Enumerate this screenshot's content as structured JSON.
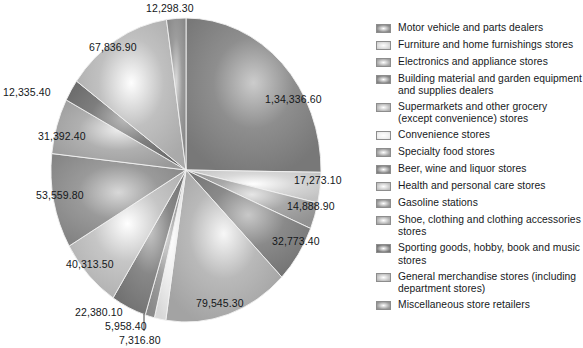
{
  "chart_data": {
    "type": "pie",
    "title": "",
    "legend_position": "right",
    "value_format": "indian-grouping",
    "categories": [
      "Motor vehicle and parts dealers",
      "Furniture and home furnishings stores",
      "Electronics and appliance stores",
      "Building material and garden equipment and supplies dealers",
      "Supermarkets and other grocery (except convenience) stores",
      "Convenience stores",
      "Specialty food stores",
      "Beer, wine and liquor stores",
      "Health and personal care stores",
      "Gasoline stations",
      "Shoe, clothing and clothing accessories stores",
      "Sporting goods, hobby, book and music stores",
      "General merchandise stores (including department stores)",
      "Miscellaneous store retailers"
    ],
    "values": [
      134336.6,
      17273.1,
      14888.9,
      32773.4,
      79545.3,
      7316.8,
      5958.4,
      22380.1,
      40313.5,
      53559.8,
      31392.4,
      12335.4,
      67836.9,
      12298.3
    ],
    "value_labels": [
      "1,34,336.60",
      "17,273.10",
      "14,888.90",
      "32,773.40",
      "79,545.30",
      "7,316.80",
      "5,958.40",
      "22,380.10",
      "40,313.50",
      "53,559.80",
      "31,392.40",
      "12,335.40",
      "67,836.90",
      "12,298.30"
    ],
    "slice_colors": [
      "#8e8e8e",
      "#d8d8d8",
      "#a8a8a8",
      "#8a8a8a",
      "#b9b9b9",
      "#eeeeee",
      "#a0a0a0",
      "#888888",
      "#c6c6c6",
      "#9a9a9a",
      "#b0b0b0",
      "#7e7e7e",
      "#c0c0c0",
      "#9c9c9c"
    ],
    "xlabel": "",
    "ylabel": ""
  },
  "legend": {
    "items": [
      {
        "label": "Motor vehicle and parts dealers",
        "color": "#8e8e8e"
      },
      {
        "label": "Furniture and home furnishings stores",
        "color": "#d8d8d8"
      },
      {
        "label": "Electronics and appliance stores",
        "color": "#a8a8a8"
      },
      {
        "label": "Building material and garden equipment and supplies dealers",
        "color": "#8a8a8a"
      },
      {
        "label": "Supermarkets and other grocery (except convenience) stores",
        "color": "#b9b9b9"
      },
      {
        "label": "Convenience stores",
        "color": "#eeeeee"
      },
      {
        "label": "Specialty food stores",
        "color": "#a0a0a0"
      },
      {
        "label": "Beer, wine and liquor stores",
        "color": "#888888"
      },
      {
        "label": "Health and personal care stores",
        "color": "#c6c6c6"
      },
      {
        "label": "Gasoline stations",
        "color": "#9a9a9a"
      },
      {
        "label": "Shoe, clothing and clothing accessories stores",
        "color": "#b0b0b0"
      },
      {
        "label": "Sporting goods, hobby, book and music stores",
        "color": "#7e7e7e"
      },
      {
        "label": "General merchandise stores (including department stores)",
        "color": "#c0c0c0"
      },
      {
        "label": "Miscellaneous store retailers",
        "color": "#9c9c9c"
      }
    ]
  },
  "pie_labels": [
    {
      "text": "12,298.30",
      "left": 146,
      "top": 2
    },
    {
      "text": "1,34,336.60",
      "left": 265,
      "top": 93
    },
    {
      "text": "17,273.10",
      "left": 294,
      "top": 174
    },
    {
      "text": "14,888.90",
      "left": 287,
      "top": 200
    },
    {
      "text": "32,773.40",
      "left": 272,
      "top": 235
    },
    {
      "text": "79,545.30",
      "left": 196,
      "top": 297
    },
    {
      "text": "7,316.80",
      "left": 119,
      "top": 334
    },
    {
      "text": "5,958.40",
      "left": 105,
      "top": 320
    },
    {
      "text": "22,380.10",
      "left": 75,
      "top": 306
    },
    {
      "text": "40,313.50",
      "left": 66,
      "top": 258
    },
    {
      "text": "53,559.80",
      "left": 36,
      "top": 189
    },
    {
      "text": "31,392.40",
      "left": 38,
      "top": 130
    },
    {
      "text": "12,335.40",
      "left": 3,
      "top": 86
    },
    {
      "text": "67,836.90",
      "left": 89,
      "top": 41
    }
  ]
}
